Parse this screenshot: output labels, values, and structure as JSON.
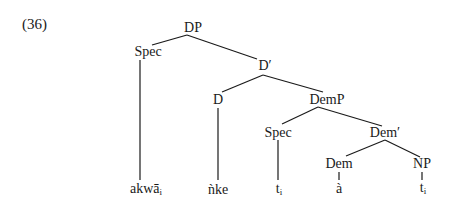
{
  "example_number": "(36)",
  "tree": {
    "nodes": {
      "dp": "DP",
      "spec1": "Spec",
      "dbar": "D′",
      "d": "D",
      "demp": "DemP",
      "spec2": "Spec",
      "dembar": "Dem′",
      "dem": "Dem",
      "np": "NP"
    },
    "leaves": {
      "akwa": {
        "text": "akwā",
        "index": "i"
      },
      "nke": {
        "text": "ǹke"
      },
      "trace1": {
        "text": "t",
        "index": "i"
      },
      "a": {
        "text": "à"
      },
      "trace2": {
        "text": "t",
        "index": "i"
      }
    }
  },
  "colors": {
    "line": "#1a1a1a",
    "text": "#1a1a1a",
    "background": "#ffffff"
  }
}
